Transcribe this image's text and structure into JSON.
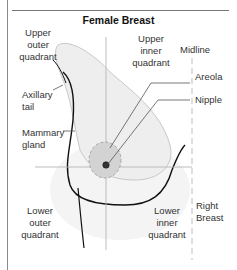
{
  "title": "Female Breast",
  "labels": {
    "upper_outer": [
      "Upper",
      "outer",
      "quadrant"
    ],
    "upper_inner": [
      "Upper",
      "inner",
      "quadrant"
    ],
    "midline": "Midline",
    "areola": "Areola",
    "nipple": "Nipple",
    "axillary_tail": [
      "Axillary",
      "tail"
    ],
    "mammary_gland": [
      "Mammary",
      "gland"
    ],
    "lower_outer": [
      "Lower",
      "outer",
      "quadrant"
    ],
    "lower_inner": [
      "Lower",
      "inner",
      "quadrant"
    ],
    "right_breast": [
      "Right",
      "Breast"
    ]
  },
  "colors": {
    "outline": "#111111",
    "gland_fill": "#ececec",
    "areola_fill": "#cfcfcf",
    "guide_line": "#b5b5b5",
    "leader_line": "#555555"
  }
}
